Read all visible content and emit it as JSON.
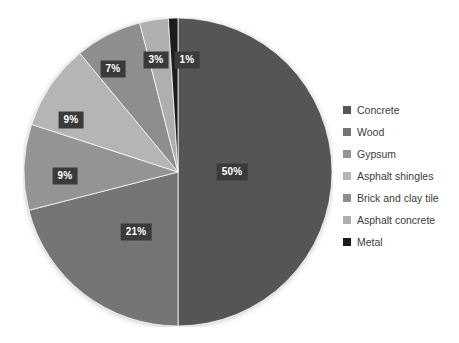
{
  "chart_data": {
    "type": "pie",
    "title": "",
    "xlabel": "",
    "ylabel": "",
    "legend_position": "right",
    "grid": false,
    "start_angle_deg": 0,
    "direction": "clockwise",
    "categories": [
      "Concrete",
      "Wood",
      "Gypsum",
      "Asphalt shingles",
      "Brick and clay tile",
      "Asphalt concrete",
      "Metal"
    ],
    "values": [
      50,
      21,
      9,
      9,
      7,
      3,
      1
    ],
    "value_labels": [
      "50%",
      "21%",
      "9%",
      "9%",
      "7%",
      "3%",
      "1%"
    ],
    "colors": [
      "#555555",
      "#757575",
      "#949494",
      "#b5b5b5",
      "#8e8e8e",
      "#afafaf",
      "#1c1c1c"
    ],
    "slices": [
      {
        "label": "Concrete",
        "value": 50,
        "display": "50%",
        "color": "#555555"
      },
      {
        "label": "Wood",
        "value": 21,
        "display": "21%",
        "color": "#757575"
      },
      {
        "label": "Gypsum",
        "value": 9,
        "display": "9%",
        "color": "#949494"
      },
      {
        "label": "Asphalt shingles",
        "value": 9,
        "display": "9%",
        "color": "#b5b5b5"
      },
      {
        "label": "Brick and clay tile",
        "value": 7,
        "display": "7%",
        "color": "#8e8e8e"
      },
      {
        "label": "Asphalt concrete",
        "value": 3,
        "display": "3%",
        "color": "#afafaf"
      },
      {
        "label": "Metal",
        "value": 1,
        "display": "1%",
        "color": "#1c1c1c"
      }
    ]
  },
  "legend": {
    "items": [
      {
        "label": "Concrete",
        "color": "#555555"
      },
      {
        "label": "Wood",
        "color": "#757575"
      },
      {
        "label": "Gypsum",
        "color": "#949494"
      },
      {
        "label": "Asphalt shingles",
        "color": "#b5b5b5"
      },
      {
        "label": "Brick and clay tile",
        "color": "#8e8e8e"
      },
      {
        "label": "Asphalt concrete",
        "color": "#afafaf"
      },
      {
        "label": "Metal",
        "color": "#1c1c1c"
      }
    ]
  },
  "labels": {
    "concrete": "50%",
    "wood": "21%",
    "gypsum": "9%",
    "asphalt_shingles": "9%",
    "brick_and_clay_tile": "7%",
    "asphalt_concrete": "3%",
    "metal": "1%"
  }
}
